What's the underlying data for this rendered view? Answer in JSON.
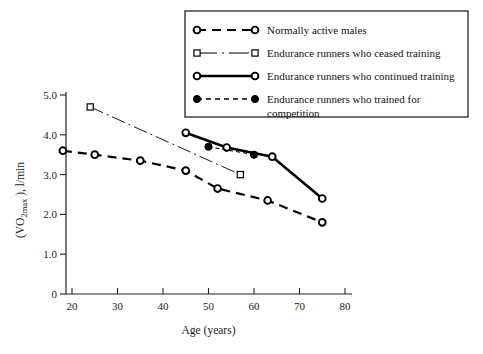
{
  "chart_data": {
    "type": "line",
    "title": "",
    "xlabel": "Age (years)",
    "ylabel": "(VO 2max ), l/min",
    "ylabel_parts": {
      "pre": "(VO",
      "sub": "2max",
      "post": " ), l/min"
    },
    "xlim": [
      15,
      82
    ],
    "ylim": [
      0,
      5.3
    ],
    "xticks": [
      20,
      30,
      40,
      50,
      60,
      70,
      80
    ],
    "xtick_labels": [
      "20",
      "30",
      "40",
      "50",
      "60",
      "70",
      "80"
    ],
    "yticks": [
      0,
      1.0,
      2.0,
      3.0,
      4.0,
      5.0
    ],
    "ytick_labels": [
      "0",
      "1.0",
      "2.0",
      "3.0",
      "4.0",
      "5.0"
    ],
    "grid": false,
    "legend_position": "top-right",
    "series": [
      {
        "name": "Normally active males",
        "style": "dashed",
        "marker": "open-circle",
        "stroke_width": 2.2,
        "dash": "9,6",
        "x": [
          18,
          25,
          35,
          45,
          52,
          63,
          75
        ],
        "y": [
          3.6,
          3.5,
          3.35,
          3.1,
          2.65,
          2.35,
          1.8
        ]
      },
      {
        "name": "Endurance runners who ceased training",
        "style": "dash-dot",
        "marker": "open-square",
        "stroke_width": 0.9,
        "dash": "14,4,2,4",
        "x": [
          24,
          57
        ],
        "y": [
          4.7,
          3.0
        ]
      },
      {
        "name": "Endurance runners who continued training",
        "style": "solid",
        "marker": "open-circle",
        "stroke_width": 2.6,
        "dash": "none",
        "x": [
          45,
          54,
          64,
          75
        ],
        "y": [
          4.05,
          3.68,
          3.45,
          2.4
        ]
      },
      {
        "name": "Endurance runners who trained for competition",
        "style": "fine-dashed",
        "marker": "filled-circle",
        "stroke_width": 1.1,
        "dash": "4,3",
        "x": [
          50,
          60
        ],
        "y": [
          3.7,
          3.5
        ]
      }
    ],
    "legend_entries": [
      {
        "label": "Normally active males",
        "marker": "open-circle",
        "style": "dashed",
        "dash": "9,6",
        "stroke_width": 2.2
      },
      {
        "label": "Endurance runners who ceased training",
        "marker": "open-square",
        "style": "dash-dot",
        "dash": "20,5,2,5",
        "stroke_width": 1.1
      },
      {
        "label": "Endurance runners who continued training",
        "marker": "open-circle",
        "style": "solid",
        "dash": "none",
        "stroke_width": 2.6
      },
      {
        "label": "Endurance runners who trained for competition",
        "marker": "filled-circle",
        "style": "fine-dashed",
        "dash": "5,4",
        "stroke_width": 1.3
      }
    ],
    "colors": {
      "ink": "#000000",
      "axis": "#222222",
      "background": "#ffffff"
    }
  }
}
